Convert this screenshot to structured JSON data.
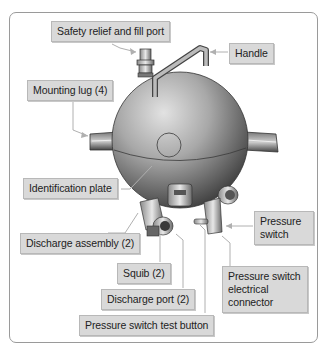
{
  "diagram": {
    "labels": {
      "safety_relief": "Safety relief and fill port",
      "handle": "Handle",
      "mounting_lug": "Mounting lug (4)",
      "identification_plate": "Identification plate",
      "discharge_assembly": "Discharge assembly (2)",
      "pressure_switch": "Pressure switch",
      "squib": "Squib (2)",
      "pressure_switch_connector": "Pressure switch electrical connector",
      "discharge_port": "Discharge port (2)",
      "pressure_switch_test_button": "Pressure switch test button"
    },
    "colors": {
      "label_fill": "#d9d9d9",
      "label_border": "#b8b8b8",
      "leader_line": "#b0b0b0",
      "frame_border": "#9a9a9a",
      "sphere_light": "#dcdcdc",
      "sphere_dark": "#4a4a4a"
    }
  }
}
